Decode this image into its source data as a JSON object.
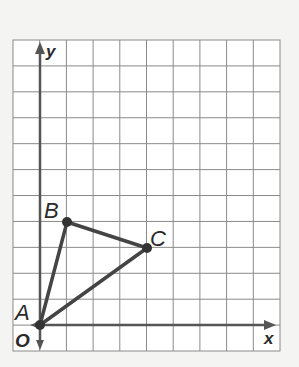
{
  "diagram": {
    "type": "coordinate-grid",
    "axes": {
      "x_label": "x",
      "y_label": "y",
      "origin_label": "O"
    },
    "grid": {
      "x_range": [
        -1,
        9
      ],
      "y_range": [
        -1,
        11
      ]
    },
    "points": [
      {
        "label": "A",
        "x": 0,
        "y": 0
      },
      {
        "label": "B",
        "x": 1,
        "y": 4
      },
      {
        "label": "C",
        "x": 4,
        "y": 3
      }
    ],
    "segments": [
      [
        "A",
        "B"
      ],
      [
        "B",
        "C"
      ],
      [
        "C",
        "A"
      ]
    ],
    "colors": {
      "grid": "#8a8a8a",
      "axes": "#555555",
      "triangle": "#444444",
      "background": "#ffffff"
    }
  }
}
